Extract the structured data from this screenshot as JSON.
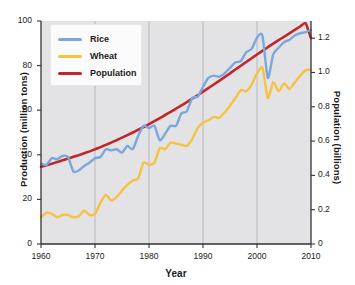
{
  "chart_data": {
    "type": "line",
    "title": "",
    "xlabel": "Year",
    "ylabel": "Production (million tons)",
    "ylabel_right": "Population (billions)",
    "xlim": [
      1960,
      2010
    ],
    "ylim": [
      0,
      100
    ],
    "ylim_right": [
      0,
      1.3
    ],
    "grid": "vertical-only",
    "legend_position": "upper-left",
    "xticks": [
      "1960",
      "1970",
      "1980",
      "1990",
      "2000",
      "2010"
    ],
    "xtick_values": [
      1960,
      1970,
      1980,
      1990,
      2000,
      2010
    ],
    "yticks_left": [
      "0",
      "20",
      "40",
      "60",
      "80",
      "100"
    ],
    "ytick_values_left": [
      0,
      20,
      40,
      60,
      80,
      100
    ],
    "yticks_right": [
      "0",
      "0.2",
      "0.4",
      "0.6",
      "0.8",
      "1.0",
      "1.2"
    ],
    "ytick_values_right": [
      0,
      0.2,
      0.4,
      0.6,
      0.8,
      1.0,
      1.2
    ],
    "colors": {
      "rice": "#7BA7DC",
      "wheat": "#F5C242",
      "population": "#C0272D",
      "plot_background": "#E3E3E6",
      "gridline": "#A8A8AE",
      "axis": "#333333",
      "figure_background": "#FFFFFF"
    },
    "x": [
      1960,
      1961,
      1962,
      1963,
      1964,
      1965,
      1966,
      1967,
      1968,
      1969,
      1970,
      1971,
      1972,
      1973,
      1974,
      1975,
      1976,
      1977,
      1978,
      1979,
      1980,
      1981,
      1982,
      1983,
      1984,
      1985,
      1986,
      1987,
      1988,
      1989,
      1990,
      1991,
      1992,
      1993,
      1994,
      1995,
      1996,
      1997,
      1998,
      1999,
      2000,
      2001,
      2002,
      2003,
      2004,
      2005,
      2006,
      2007,
      2008,
      2009,
      2010
    ],
    "series": [
      {
        "name": "Rice",
        "axis": "left",
        "unit": "million tons",
        "color": "#7BA7DC",
        "values": [
          36.0,
          35.5,
          38.5,
          38.0,
          39.5,
          39.0,
          32.5,
          33.0,
          35.0,
          36.5,
          38.5,
          39.0,
          42.5,
          42.0,
          42.5,
          41.0,
          44.0,
          42.5,
          48.5,
          53.0,
          52.0,
          53.0,
          46.5,
          49.5,
          53.0,
          53.0,
          58.5,
          59.5,
          65.5,
          66.0,
          70.5,
          74.5,
          75.5,
          75.0,
          76.5,
          79.0,
          81.5,
          82.0,
          86.0,
          87.5,
          92.5,
          93.5,
          74.5,
          85.0,
          88.0,
          90.5,
          91.5,
          93.5,
          94.5,
          95.0,
          96.0
        ]
      },
      {
        "name": "Wheat",
        "axis": "left",
        "unit": "million tons",
        "color": "#F5C242",
        "values": [
          12.0,
          14.0,
          13.5,
          12.0,
          13.0,
          13.0,
          12.0,
          12.5,
          15.0,
          13.0,
          13.5,
          18.5,
          22.0,
          19.5,
          21.0,
          24.0,
          26.5,
          28.5,
          29.5,
          36.5,
          35.5,
          36.5,
          43.0,
          42.5,
          45.5,
          45.0,
          44.5,
          44.0,
          47.0,
          52.0,
          54.5,
          55.5,
          57.0,
          56.5,
          59.0,
          62.0,
          65.5,
          69.0,
          68.5,
          71.5,
          76.5,
          79.0,
          65.5,
          72.5,
          68.5,
          72.0,
          69.5,
          72.5,
          75.5,
          78.0,
          78.0
        ]
      },
      {
        "name": "Population",
        "axis": "right",
        "unit": "billions",
        "color": "#C0272D",
        "values": [
          0.45,
          0.459,
          0.468,
          0.478,
          0.488,
          0.498,
          0.508,
          0.518,
          0.529,
          0.54,
          0.552,
          0.565,
          0.578,
          0.591,
          0.605,
          0.62,
          0.635,
          0.65,
          0.666,
          0.682,
          0.699,
          0.716,
          0.734,
          0.752,
          0.77,
          0.789,
          0.808,
          0.827,
          0.847,
          0.867,
          0.888,
          0.909,
          0.93,
          0.951,
          0.973,
          0.995,
          1.017,
          1.039,
          1.061,
          1.083,
          1.105,
          1.126,
          1.147,
          1.168,
          1.188,
          1.208,
          1.228,
          1.248,
          1.268,
          1.288,
          1.2
        ]
      }
    ]
  },
  "legend": {
    "items": [
      {
        "label": "Rice"
      },
      {
        "label": "Wheat"
      },
      {
        "label": "Population"
      }
    ]
  }
}
